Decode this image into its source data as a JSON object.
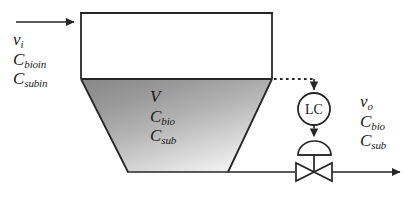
{
  "diagram": {
    "type": "process-flow-diagram",
    "colors": {
      "line": "#262626",
      "text": "#1a1a1a",
      "liquid_dark": "#8d8d8d",
      "liquid_light": "#f2f2f2",
      "background": "#ffffff"
    }
  },
  "inlet": {
    "name": "feed-stream",
    "labels": [
      {
        "base": "v",
        "sub": "i"
      },
      {
        "base": "C",
        "sub": "bioin"
      },
      {
        "base": "C",
        "sub": "subin"
      }
    ]
  },
  "tank": {
    "name": "bioreactor-vessel",
    "contents_labels": [
      {
        "base": "V",
        "sub": ""
      },
      {
        "base": "C",
        "sub": "bio"
      },
      {
        "base": "C",
        "sub": "sub"
      }
    ]
  },
  "outlet": {
    "name": "effluent-stream",
    "labels": [
      {
        "base": "v",
        "sub": "o"
      },
      {
        "base": "C",
        "sub": "bio"
      },
      {
        "base": "C",
        "sub": "sub"
      }
    ]
  },
  "controller": {
    "tag": "LC",
    "description": "level-controller"
  },
  "valve": {
    "description": "diaphragm-actuated-control-valve"
  },
  "signal_line": {
    "description": "level-measurement-signal",
    "style": "dotted"
  }
}
